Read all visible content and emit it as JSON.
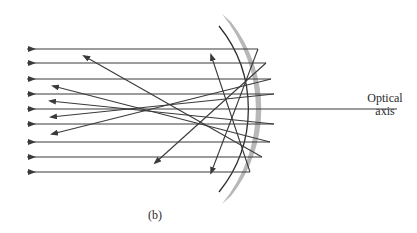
{
  "labels": {
    "optical_axis_line1": "Optical",
    "optical_axis_line2": "axis",
    "caption": "(b)"
  },
  "colors": {
    "ray": "#3a3a3a",
    "mirror_fill": "#b5b5b5",
    "mirror_edge": "#2e2e2e",
    "background": "#ffffff"
  },
  "diagram": {
    "type": "concave spherical mirror with parallel incident rays (spherical aberration)",
    "incident_rays_y": [
      49,
      63,
      79,
      94,
      109,
      124,
      142,
      157,
      172
    ],
    "incident_ray_count": 9,
    "reflected_ray_count": 8,
    "optical_axis_y": 109
  }
}
